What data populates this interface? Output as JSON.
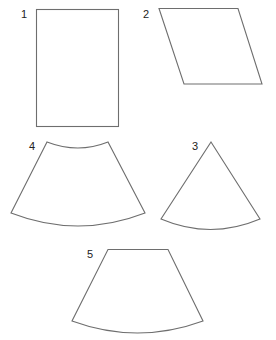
{
  "diagram": {
    "stroke_color": "#6e6e6e",
    "label_color": "#222222",
    "shapes": [
      {
        "id": 1,
        "label": "1",
        "kind": "rectangle"
      },
      {
        "id": 2,
        "label": "2",
        "kind": "parallelogram"
      },
      {
        "id": 3,
        "label": "3",
        "kind": "circular-sector"
      },
      {
        "id": 4,
        "label": "4",
        "kind": "annular-sector"
      },
      {
        "id": 5,
        "label": "5",
        "kind": "trapezoid-with-curved-base"
      }
    ]
  }
}
